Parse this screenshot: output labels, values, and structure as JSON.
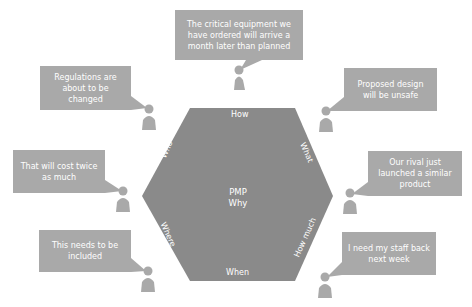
{
  "colors": {
    "hexagon": "#8a8a8a",
    "bubble": "#a9a9a9",
    "person": "#a9a9a9",
    "text": "#ffffff",
    "background": "#ffffff"
  },
  "hexagon": {
    "center_lines": [
      "PMP",
      "Why"
    ],
    "edge_labels": {
      "top": "How",
      "upper_right": "What",
      "lower_right": "How much",
      "bottom": "When",
      "lower_left": "Where",
      "upper_left": "Who"
    }
  },
  "bubbles": [
    {
      "id": "top",
      "text": "The critical equipment we have ordered will arrive a month later than planned"
    },
    {
      "id": "left-1",
      "text": "Regulations are about to be changed"
    },
    {
      "id": "left-2",
      "text": "That will cost twice as much"
    },
    {
      "id": "left-3",
      "text": "This needs to be included"
    },
    {
      "id": "right-1",
      "text": "Proposed design will be unsafe"
    },
    {
      "id": "right-2",
      "text": "Our rival just launched a similar product"
    },
    {
      "id": "right-3",
      "text": "I need my staff back next week"
    }
  ]
}
